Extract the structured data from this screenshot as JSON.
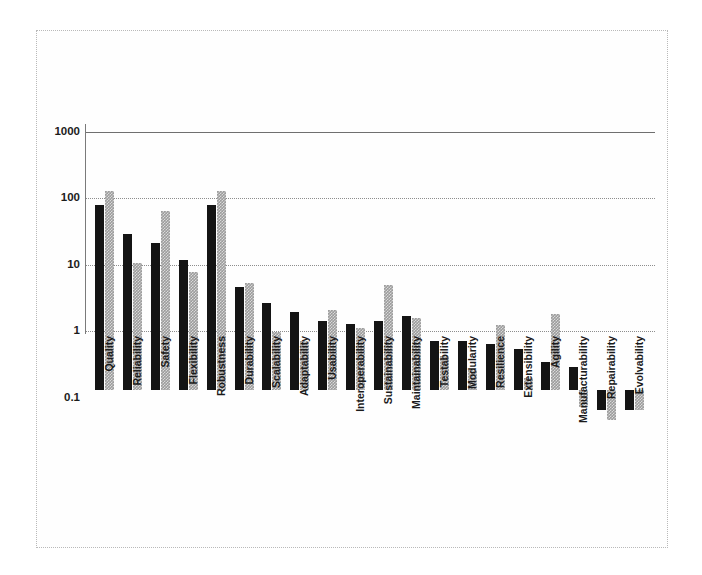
{
  "chart_data": {
    "type": "bar",
    "title": "",
    "subtitle": "",
    "xlabel": "",
    "ylabel": "",
    "yscale": "log",
    "ylim": [
      0.1,
      1000
    ],
    "ytick_labels": [
      "1000",
      "100",
      "10",
      "1",
      "0.1"
    ],
    "ytick_values": [
      1000,
      100,
      10,
      1,
      0.1
    ],
    "grid": true,
    "grid_axis": "y",
    "legend": "none",
    "bar_orientation": "vertical",
    "categories": [
      "Quality",
      "Reliability",
      "Safety",
      "Flexibility",
      "Robustness",
      "Durability",
      "Scalability",
      "Adaptability",
      "Usability",
      "Interoperability",
      "Sustainability",
      "Maintainability",
      "Testability",
      "Modularity",
      "Resilience",
      "Extensibility",
      "Agility",
      "Manufacturability",
      "Repairability",
      "Evolvability"
    ],
    "series": [
      {
        "name": "series-1",
        "color": "#141414",
        "values": [
          600,
          220,
          160,
          90,
          600,
          36,
          20,
          15,
          11,
          10,
          11,
          13,
          5.5,
          5.5,
          5,
          4.2,
          2.6,
          2.2,
          0.5,
          0.5
        ]
      },
      {
        "name": "series-2",
        "color": "#9c9c9c",
        "values": [
          1000,
          80,
          500,
          60,
          1000,
          40,
          7.5,
          5.5,
          16,
          8.5,
          38,
          12,
          3.3,
          2,
          9.5,
          1.5,
          14,
          0.55,
          0.35,
          0.5
        ]
      }
    ]
  },
  "colors": {
    "series_dark": "#141414",
    "series_gray": "#9c9c9c",
    "gridline": "#8d8d8d",
    "axis": "#7a7a7a",
    "frame": "#b9b9b9",
    "background": "#ffffff",
    "text": "#1b1b1b"
  }
}
